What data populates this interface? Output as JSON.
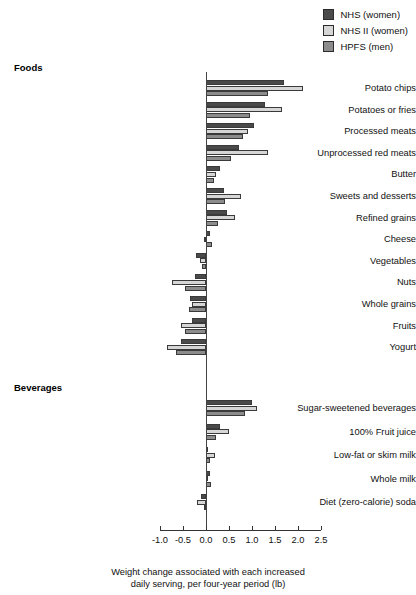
{
  "legend": {
    "items": [
      {
        "label": "NHS (women)",
        "key": "nhs",
        "color": "#4a4a4a"
      },
      {
        "label": "NHS II (women)",
        "key": "nhs2",
        "color": "#d6d6d6"
      },
      {
        "label": "HPFS (men)",
        "key": "hpfs",
        "color": "#8c8c8c"
      }
    ]
  },
  "sections": [
    {
      "name": "foods-heading",
      "label": "Foods"
    },
    {
      "name": "beverages-heading",
      "label": "Beverages"
    }
  ],
  "axis": {
    "ticks": [
      "-1.0",
      "-0.5",
      "0.0",
      "0.5",
      "1.0",
      "1.5",
      "2.0",
      "2.5"
    ],
    "title_line1": "Weight change associated with each increased",
    "title_line2": "daily serving, per four-year period (lb)"
  },
  "chart_data": {
    "type": "bar",
    "orientation": "horizontal",
    "title": "",
    "xlabel": "Weight change associated with each increased daily serving, per four-year period (lb)",
    "ylabel": "",
    "xlim": [
      -1.0,
      2.5
    ],
    "xticks": [
      -1.0,
      -0.5,
      0.0,
      0.5,
      1.0,
      1.5,
      2.0,
      2.5
    ],
    "grid": false,
    "legend_position": "top-right",
    "groups": [
      {
        "group": "Foods",
        "categories": [
          "Potato chips",
          "Potatoes or fries",
          "Processed meats",
          "Unprocessed red meats",
          "Butter",
          "Sweets and desserts",
          "Refined grains",
          "Cheese",
          "Vegetables",
          "Nuts",
          "Whole grains",
          "Fruits",
          "Yogurt"
        ]
      },
      {
        "group": "Beverages",
        "categories": [
          "Sugar-sweetened beverages",
          "100% Fruit juice",
          "Low-fat or skim milk",
          "Whole milk",
          "Diet (zero-calorie) soda"
        ]
      }
    ],
    "categories": [
      "Potato chips",
      "Potatoes or fries",
      "Processed meats",
      "Unprocessed red meats",
      "Butter",
      "Sweets and desserts",
      "Refined grains",
      "Cheese",
      "Vegetables",
      "Nuts",
      "Whole grains",
      "Fruits",
      "Yogurt",
      "Sugar-sweetened beverages",
      "100% Fruit juice",
      "Low-fat or skim milk",
      "Whole milk",
      "Diet (zero-calorie) soda"
    ],
    "series": [
      {
        "name": "NHS (women)",
        "key": "nhs",
        "color": "#4a4a4a",
        "values": [
          1.7,
          1.28,
          1.05,
          0.72,
          0.3,
          0.4,
          0.45,
          0.08,
          -0.22,
          -0.25,
          -0.35,
          -0.3,
          -0.55,
          1.0,
          0.3,
          0.05,
          0.08,
          -0.1
        ]
      },
      {
        "name": "NHS II (women)",
        "key": "nhs2",
        "color": "#d6d6d6",
        "values": [
          2.1,
          1.65,
          0.92,
          1.35,
          0.22,
          0.75,
          0.62,
          -0.05,
          -0.12,
          -0.75,
          -0.3,
          -0.55,
          -0.85,
          1.1,
          0.5,
          0.2,
          0.05,
          -0.2
        ]
      },
      {
        "name": "HPFS (men)",
        "key": "hpfs",
        "color": "#8c8c8c",
        "values": [
          1.35,
          0.95,
          0.8,
          0.55,
          0.18,
          0.42,
          0.25,
          0.13,
          -0.08,
          -0.45,
          -0.38,
          -0.45,
          -0.65,
          0.85,
          0.22,
          0.08,
          0.1,
          -0.05
        ]
      }
    ]
  }
}
